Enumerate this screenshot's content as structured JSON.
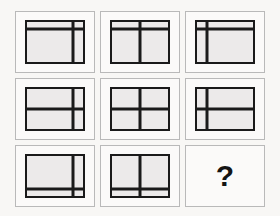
{
  "puzzle": {
    "type": "matrix-reasoning",
    "title": "Matrix Reasoning Puzzle",
    "rows": 3,
    "columns": 3,
    "colors": {
      "background": "#f8f7f5",
      "cell_background": "#fbfaf9",
      "cell_border": "#b9b9b9",
      "figure_fill": "#eceaea",
      "line": "#1a1a1a",
      "question_mark": "#141414"
    },
    "row_rule": "horizontal divider moves top -> middle -> bottom",
    "column_rule": "vertical divider moves right -> center -> left",
    "cells": [
      {
        "index": 1,
        "row": 1,
        "column": 1,
        "kind": "figure",
        "horizontal_position": "top",
        "vertical_position": "right",
        "label": "horizontal divider near top, vertical divider near right"
      },
      {
        "index": 2,
        "row": 1,
        "column": 2,
        "kind": "figure",
        "horizontal_position": "top",
        "vertical_position": "center",
        "label": "horizontal divider near top, vertical divider at center"
      },
      {
        "index": 3,
        "row": 1,
        "column": 3,
        "kind": "figure",
        "horizontal_position": "top",
        "vertical_position": "left",
        "label": "horizontal divider near top, vertical divider near left"
      },
      {
        "index": 4,
        "row": 2,
        "column": 1,
        "kind": "figure",
        "horizontal_position": "middle",
        "vertical_position": "right",
        "label": "horizontal divider at middle, vertical divider near right"
      },
      {
        "index": 5,
        "row": 2,
        "column": 2,
        "kind": "figure",
        "horizontal_position": "middle",
        "vertical_position": "center",
        "label": "horizontal divider at middle, vertical divider at center"
      },
      {
        "index": 6,
        "row": 2,
        "column": 3,
        "kind": "figure",
        "horizontal_position": "middle",
        "vertical_position": "left",
        "label": "horizontal divider at middle, vertical divider near left"
      },
      {
        "index": 7,
        "row": 3,
        "column": 1,
        "kind": "figure",
        "horizontal_position": "bottom",
        "vertical_position": "right",
        "label": "horizontal divider near bottom, vertical divider near right"
      },
      {
        "index": 8,
        "row": 3,
        "column": 2,
        "kind": "figure",
        "horizontal_position": "bottom",
        "vertical_position": "center",
        "label": "horizontal divider near bottom, vertical divider at center"
      },
      {
        "index": 9,
        "row": 3,
        "column": 3,
        "kind": "answer",
        "horizontal_position": "bottom",
        "vertical_position": "left",
        "label": "missing tile",
        "text": "?"
      }
    ]
  }
}
